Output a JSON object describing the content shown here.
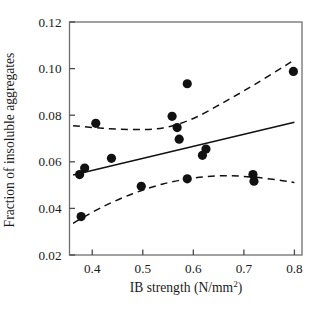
{
  "figure": {
    "background_color": "#ffffff",
    "foreground_color": "#1a1a1a",
    "width": 317,
    "height": 310
  },
  "chart_data": {
    "type": "scatter",
    "title": "",
    "subtitle": "",
    "xlabel": "IB strength (N/mm2)",
    "xlabel_base": "IB strength (N/mm",
    "xlabel_sup": "2",
    "xlabel_tail": ")",
    "ylabel": "Fraction of insoluble aggregates",
    "xlim": [
      0.355,
      0.815
    ],
    "ylim": [
      0.02,
      0.12
    ],
    "xticks": [
      0.4,
      0.5,
      0.6,
      0.7,
      0.8
    ],
    "xtick_labels": [
      "0.4",
      "0.5",
      "0.6",
      "0.7",
      "0.8"
    ],
    "yticks": [
      0.02,
      0.04,
      0.06,
      0.08,
      0.1,
      0.12
    ],
    "ytick_labels": [
      "0.02",
      "0.04",
      "0.06",
      "0.08",
      "0.10",
      "0.12"
    ],
    "grid": false,
    "legend": false,
    "legend_position": "none",
    "marker": {
      "shape": "circle",
      "color": "#111111",
      "radius_px": 4.6
    },
    "points": [
      {
        "x": 0.375,
        "y": 0.0545
      },
      {
        "x": 0.385,
        "y": 0.0573
      },
      {
        "x": 0.378,
        "y": 0.0365
      },
      {
        "x": 0.407,
        "y": 0.0765
      },
      {
        "x": 0.438,
        "y": 0.0615
      },
      {
        "x": 0.497,
        "y": 0.0495
      },
      {
        "x": 0.558,
        "y": 0.0795
      },
      {
        "x": 0.568,
        "y": 0.0747
      },
      {
        "x": 0.572,
        "y": 0.0697
      },
      {
        "x": 0.588,
        "y": 0.0935
      },
      {
        "x": 0.588,
        "y": 0.0527
      },
      {
        "x": 0.618,
        "y": 0.0628
      },
      {
        "x": 0.625,
        "y": 0.0655
      },
      {
        "x": 0.718,
        "y": 0.0545
      },
      {
        "x": 0.72,
        "y": 0.0517
      },
      {
        "x": 0.798,
        "y": 0.0988
      }
    ],
    "series": [
      {
        "name": "regression-line",
        "style": "solid",
        "color": "#111111",
        "points": [
          {
            "x": 0.362,
            "y": 0.0543
          },
          {
            "x": 0.8,
            "y": 0.077
          }
        ]
      },
      {
        "name": "upper-confidence-band",
        "style": "dashed",
        "color": "#111111",
        "points": [
          {
            "x": 0.362,
            "y": 0.0755
          },
          {
            "x": 0.42,
            "y": 0.0744
          },
          {
            "x": 0.48,
            "y": 0.0739
          },
          {
            "x": 0.54,
            "y": 0.0745
          },
          {
            "x": 0.6,
            "y": 0.0786
          },
          {
            "x": 0.66,
            "y": 0.0855
          },
          {
            "x": 0.72,
            "y": 0.093
          },
          {
            "x": 0.78,
            "y": 0.101
          },
          {
            "x": 0.8,
            "y": 0.1038
          }
        ]
      },
      {
        "name": "lower-confidence-band",
        "style": "dashed",
        "color": "#111111",
        "points": [
          {
            "x": 0.362,
            "y": 0.0336
          },
          {
            "x": 0.42,
            "y": 0.0406
          },
          {
            "x": 0.48,
            "y": 0.0463
          },
          {
            "x": 0.54,
            "y": 0.0505
          },
          {
            "x": 0.6,
            "y": 0.053
          },
          {
            "x": 0.66,
            "y": 0.054
          },
          {
            "x": 0.72,
            "y": 0.0534
          },
          {
            "x": 0.78,
            "y": 0.0518
          },
          {
            "x": 0.8,
            "y": 0.0511
          }
        ]
      }
    ]
  }
}
